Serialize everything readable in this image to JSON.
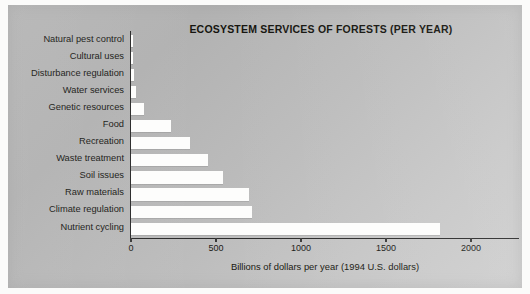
{
  "chart_data": {
    "type": "bar",
    "orientation": "horizontal",
    "title": "ECOSYSTEM SERVICES OF FORESTS (PER YEAR)",
    "xlabel": "Billions of dollars per year (1994 U.S. dollars)",
    "ylabel": "",
    "xlim": [
      0,
      2200
    ],
    "xticks": [
      0,
      500,
      1000,
      1500,
      2000
    ],
    "xtick_labels": [
      "0",
      "500",
      "1000",
      "1500",
      "2000"
    ],
    "grid": false,
    "legend": false,
    "categories": [
      "Natural pest control",
      "Cultural uses",
      "Disturbance regulation",
      "Water services",
      "Genetic resources",
      "Food",
      "Recreation",
      "Waste treatment",
      "Soil issues",
      "Raw materials",
      "Climate regulation",
      "Nutrient cycling"
    ],
    "values": [
      10,
      12,
      15,
      30,
      75,
      235,
      345,
      450,
      540,
      695,
      710,
      1815
    ],
    "bar_color": "#fdfdfc",
    "panel_color": "#bdbdbd",
    "axis_color": "#2b2b2b"
  }
}
